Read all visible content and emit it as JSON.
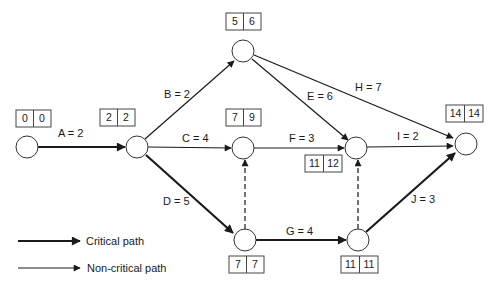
{
  "diagram": {
    "type": "activity-on-arrow network",
    "colors": {
      "line": "#1a1a1a",
      "background": "#ffffff"
    },
    "nodes": [
      {
        "id": "n1",
        "early": "0",
        "late": "0"
      },
      {
        "id": "n2",
        "early": "2",
        "late": "2"
      },
      {
        "id": "n3",
        "early": "5",
        "late": "6"
      },
      {
        "id": "n4",
        "early": "7",
        "late": "9"
      },
      {
        "id": "n5",
        "early": "7",
        "late": "7"
      },
      {
        "id": "n6",
        "early": "11",
        "late": "12"
      },
      {
        "id": "n7",
        "early": "11",
        "late": "11"
      },
      {
        "id": "n8",
        "early": "14",
        "late": "14"
      }
    ],
    "activities": [
      {
        "label": "A = 2",
        "from": "n1",
        "to": "n2",
        "critical": true
      },
      {
        "label": "B = 2",
        "from": "n2",
        "to": "n3",
        "critical": false
      },
      {
        "label": "C = 4",
        "from": "n2",
        "to": "n4",
        "critical": false
      },
      {
        "label": "D = 5",
        "from": "n2",
        "to": "n5",
        "critical": true
      },
      {
        "label": "E = 6",
        "from": "n3",
        "to": "n6",
        "critical": false
      },
      {
        "label": "H = 7",
        "from": "n3",
        "to": "n8",
        "critical": false
      },
      {
        "label": "F = 3",
        "from": "n4",
        "to": "n6",
        "critical": false
      },
      {
        "label": "G = 4",
        "from": "n5",
        "to": "n7",
        "critical": true
      },
      {
        "label": "I = 2",
        "from": "n6",
        "to": "n8",
        "critical": false
      },
      {
        "label": "J = 3",
        "from": "n7",
        "to": "n8",
        "critical": true
      }
    ],
    "dummies": [
      {
        "from": "n5",
        "to": "n4"
      },
      {
        "from": "n7",
        "to": "n6"
      }
    ]
  },
  "legend": {
    "critical": "Critical path",
    "noncritical": "Non-critical path"
  }
}
